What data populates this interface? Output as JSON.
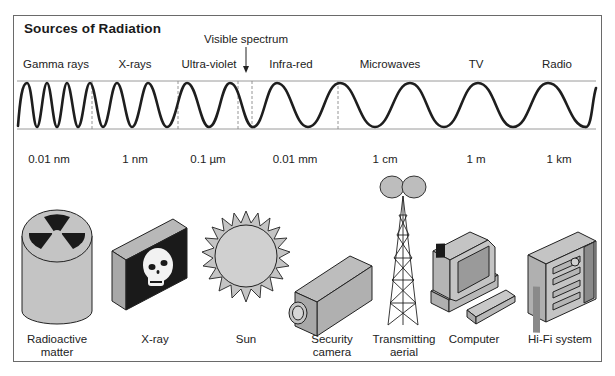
{
  "title": "Sources of Radiation",
  "visible_spectrum": {
    "label": "Visible spectrum",
    "arrow_icon": "down-arrow-icon"
  },
  "bands": [
    {
      "label": "Gamma rays",
      "x": 56
    },
    {
      "label": "X-rays",
      "x": 135
    },
    {
      "label": "Ultra-violet",
      "x": 209
    },
    {
      "label": "Infra-red",
      "x": 291
    },
    {
      "label": "Microwaves",
      "x": 390
    },
    {
      "label": "TV",
      "x": 476
    },
    {
      "label": "Radio",
      "x": 557
    }
  ],
  "wavelengths": [
    {
      "label": "0.01 nm",
      "x": 49
    },
    {
      "label": "1 nm",
      "x": 135
    },
    {
      "label": "0.1 µm",
      "x": 208
    },
    {
      "label": "0.01 mm",
      "x": 295
    },
    {
      "label": "1 cm",
      "x": 385
    },
    {
      "label": "1 m",
      "x": 476
    },
    {
      "label": "1 km",
      "x": 559
    }
  ],
  "sources": [
    {
      "label": "Radioactive\nmatter",
      "line1": "Radioactive",
      "line2": "matter",
      "icon": "radioactive-barrel-icon",
      "x": 57
    },
    {
      "label": "X-ray",
      "line1": "X-ray",
      "line2": "",
      "icon": "xray-skull-icon",
      "x": 155
    },
    {
      "label": "Sun",
      "line1": "Sun",
      "line2": "",
      "icon": "sun-icon",
      "x": 246
    },
    {
      "label": "Security\ncamera",
      "line1": "Security",
      "line2": "camera",
      "icon": "security-camera-icon",
      "x": 332
    },
    {
      "label": "Transmitting\naerial",
      "line1": "Transmitting",
      "line2": "aerial",
      "icon": "transmitting-aerial-icon",
      "x": 404
    },
    {
      "label": "Computer",
      "line1": "Computer",
      "line2": "",
      "icon": "computer-icon",
      "x": 474
    },
    {
      "label": "Hi-Fi system",
      "line1": "Hi-Fi system",
      "line2": "",
      "icon": "hifi-system-icon",
      "x": 560
    }
  ],
  "colors": {
    "wave": "#1e1e1e",
    "guide_lines": "#9a9a9a",
    "dashed": "#8a8a8a",
    "icon_fill": "#c4c4c4",
    "icon_dark": "#1a1a1a",
    "frame": "#6a6a6a"
  }
}
